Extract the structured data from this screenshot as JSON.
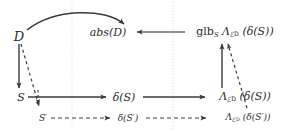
{
  "figure": {
    "type": "commutative-diagram",
    "background_color": "#ffffff",
    "ink_color": "#2b2b2b",
    "guide_color": "#d9d2d2"
  },
  "nodes": {
    "domain": "ᴰ",
    "domain_label": "D",
    "abs_domain_prefix": "abs(",
    "abs_domain_arg": "D",
    "abs_domain_suffix": ")",
    "glb_name": "glb",
    "glb_sub": "S",
    "lambda_symbol": "Λ",
    "lambda_sub_E": "ℰ",
    "lambda_sub_D": "D",
    "glb_arg": "(δ(S))",
    "state": "S",
    "state_prime": "S′",
    "delta_state": "δ(S)",
    "delta_state_prime": "δ(S′)",
    "lambda_arg_state": "(δ(S))",
    "lambda_arg_state_prime": "(δ(S′))"
  },
  "edges": [
    {
      "name": "curved-D-to-absD",
      "style": "solid",
      "from": "domain",
      "to": "abs-domain"
    },
    {
      "name": "D-to-S",
      "style": "solid",
      "from": "domain",
      "to": "state"
    },
    {
      "name": "D-to-Sprime",
      "style": "dashed",
      "from": "domain",
      "to": "state-prime"
    },
    {
      "name": "S-to-Sprime",
      "style": "dashed",
      "from": "state",
      "to": "state-prime"
    },
    {
      "name": "S-to-deltaS",
      "style": "solid",
      "from": "state",
      "to": "delta-state"
    },
    {
      "name": "deltaS-to-lambdaS",
      "style": "solid",
      "from": "delta-state",
      "to": "lambda-state"
    },
    {
      "name": "Sprime-to-deltaSprime",
      "style": "dashed",
      "from": "state-prime",
      "to": "delta-state-prime"
    },
    {
      "name": "deltaSprime-to-lambdaSprime",
      "style": "dashed",
      "from": "delta-state-prime",
      "to": "lambda-state-prime"
    },
    {
      "name": "lambdaS-to-glb",
      "style": "solid",
      "from": "lambda-state",
      "to": "glb"
    },
    {
      "name": "lambdaSprime-to-glb",
      "style": "dashed",
      "from": "lambda-state-prime",
      "to": "glb"
    },
    {
      "name": "glb-to-absD",
      "style": "solid",
      "from": "glb",
      "to": "abs-domain"
    }
  ],
  "guides": [
    {
      "name": "vertical-guide-left",
      "x": 72
    },
    {
      "name": "vertical-guide-right",
      "x": 173
    }
  ]
}
